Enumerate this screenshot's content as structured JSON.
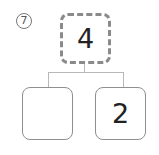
{
  "problem": {
    "number_label": "⑦"
  },
  "number_bond": {
    "whole": "4",
    "parts": [
      "",
      "2"
    ]
  },
  "colors": {
    "box_border": "#8f8f8f",
    "connector": "#b8b8b8",
    "text": "#222222"
  }
}
